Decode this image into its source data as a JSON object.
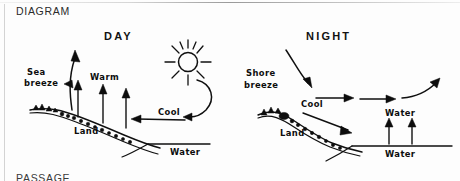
{
  "page": {
    "section_label": "DIAGRAM",
    "footer_label": "PASSAGE",
    "ink_color": "#101010",
    "background_color": "#fdfdfd"
  },
  "diagram": {
    "type": "hand-drawn science diagram",
    "panels": [
      {
        "id": "day",
        "title": "DAY",
        "has_sun": true,
        "labels": [
          {
            "name": "sea-breeze",
            "text_lines": [
              "Sea",
              "breeze"
            ],
            "x": 27,
            "y": 72
          },
          {
            "name": "warm",
            "text": "Warm",
            "x": 90,
            "y": 77
          },
          {
            "name": "cool",
            "text": "Cool",
            "x": 158,
            "y": 113
          },
          {
            "name": "land",
            "text": "Land",
            "x": 74,
            "y": 131
          },
          {
            "name": "water",
            "text": "Water",
            "x": 173,
            "y": 150
          }
        ],
        "arrows": [
          {
            "name": "sea-breeze-arrow",
            "direction": "up-curving-left"
          },
          {
            "name": "warm-rising-arrow-1",
            "direction": "up"
          },
          {
            "name": "warm-rising-arrow-2",
            "direction": "up"
          },
          {
            "name": "warm-rising-arrow-3",
            "direction": "up"
          },
          {
            "name": "cool-inflow-arrow",
            "direction": "left"
          },
          {
            "name": "sun-descending-arrow",
            "direction": "down-curving-left"
          }
        ]
      },
      {
        "id": "night",
        "title": "NIGHT",
        "has_sun": false,
        "labels": [
          {
            "name": "shore-breeze",
            "text_lines": [
              "Shore",
              "breeze"
            ],
            "x": 248,
            "y": 73
          },
          {
            "name": "cool",
            "text": "Cool",
            "x": 303,
            "y": 104
          },
          {
            "name": "land",
            "text": "Land",
            "x": 282,
            "y": 133
          },
          {
            "name": "water-upper",
            "text": "Water",
            "x": 388,
            "y": 113
          },
          {
            "name": "water-lower",
            "text": "Water",
            "x": 388,
            "y": 152
          }
        ],
        "arrows": [
          {
            "name": "shore-breeze-arrow",
            "direction": "down-right-curve"
          },
          {
            "name": "cool-outflow-arrow-1",
            "direction": "right"
          },
          {
            "name": "cool-outflow-arrow-2",
            "direction": "right"
          },
          {
            "name": "cool-outflow-arrow-3",
            "direction": "right-rising"
          },
          {
            "name": "cool-downslope-arrow",
            "direction": "down-right"
          },
          {
            "name": "water-rising-arrow-1",
            "direction": "up"
          },
          {
            "name": "water-rising-arrow-2",
            "direction": "up"
          }
        ]
      }
    ]
  }
}
